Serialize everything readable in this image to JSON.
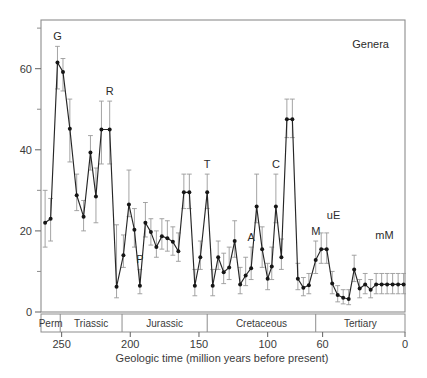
{
  "figure": {
    "panel_label": "(b)",
    "series_note": "Genera"
  },
  "chart_data": {
    "type": "line",
    "title": "",
    "subtitle": "",
    "xlabel": "Geologic time (million years before present)",
    "ylabel": "",
    "series_label": "Genera",
    "panel_label": "(b)",
    "xlim": [
      265,
      0
    ],
    "ylim": [
      0,
      72
    ],
    "x_reversed": true,
    "grid": false,
    "legend_position": "none",
    "x_ticks_major": [
      250,
      200,
      150,
      100,
      60,
      0
    ],
    "x_tick_labels": [
      "250",
      "200",
      "150",
      "100",
      "60",
      "0"
    ],
    "y_ticks_major": [
      0,
      20,
      40,
      60
    ],
    "y_tick_labels": [
      "0",
      "20",
      "40",
      "60"
    ],
    "y_ticks_minor": [
      10,
      30,
      50,
      70
    ],
    "marker": "filled-circle",
    "error_bars": "vertical",
    "period_bands": [
      {
        "name": "Perm",
        "start": 265,
        "end": 251
      },
      {
        "name": "Triassic",
        "start": 251,
        "end": 206
      },
      {
        "name": "Jurassic",
        "start": 206,
        "end": 144
      },
      {
        "name": "Cretaceous",
        "start": 144,
        "end": 65
      },
      {
        "name": "Tertiary",
        "start": 65,
        "end": 0
      }
    ],
    "annotations": [
      {
        "label": "G",
        "x": 253,
        "y": 61.5
      },
      {
        "label": "R",
        "x": 215,
        "y": 45.0
      },
      {
        "label": "P",
        "x": 193,
        "y": 26.5
      },
      {
        "label": "T",
        "x": 144,
        "y": 29.5
      },
      {
        "label": "A",
        "x": 112,
        "y": 17.5
      },
      {
        "label": "C",
        "x": 94,
        "y": 26.0
      },
      {
        "label": "M",
        "x": 65,
        "y": 47.5
      },
      {
        "label": "uE",
        "x": 52,
        "y": 15.5
      },
      {
        "label": "mM",
        "x": 15,
        "y": 10.5
      }
    ],
    "x": [
      262,
      258,
      253,
      249,
      244,
      239,
      234,
      229,
      225,
      221,
      215,
      210,
      205,
      201,
      197,
      193,
      189,
      185,
      181,
      177,
      173,
      169,
      165,
      161,
      157,
      153,
      149,
      144,
      140,
      136,
      132,
      128,
      124,
      120,
      116,
      112,
      108,
      104,
      100,
      97,
      94,
      90,
      86,
      82,
      78,
      74,
      70,
      65,
      61,
      57,
      53,
      49,
      45,
      41,
      37,
      33,
      29,
      25,
      21,
      17,
      13,
      9,
      5,
      1
    ],
    "y": [
      22.0,
      23.0,
      61.5,
      59.2,
      45.2,
      28.8,
      23.5,
      39.3,
      28.5,
      45.0,
      45.0,
      6.2,
      14.0,
      26.5,
      20.3,
      6.5,
      22.0,
      19.7,
      16.0,
      18.7,
      18.2,
      17.3,
      15.0,
      29.5,
      29.5,
      6.5,
      13.5,
      29.5,
      6.5,
      13.5,
      9.8,
      11.0,
      17.5,
      6.8,
      9.0,
      10.8,
      26.0,
      15.5,
      8.2,
      11.2,
      26.0,
      13.5,
      47.5,
      47.5,
      8.2,
      6.0,
      6.6,
      12.8,
      15.5,
      15.5,
      7.0,
      4.2,
      3.5,
      3.2,
      10.5,
      5.8,
      6.8,
      5.5,
      6.8,
      6.8,
      6.8,
      6.8,
      6.8,
      6.8
    ],
    "values_note": "Genus-level origination/extinction metric per stratigraphic interval",
    "err_low": [
      16.0,
      17.5,
      55.0,
      54.5,
      37.0,
      25.0,
      20.0,
      35.0,
      22.0,
      36.5,
      36.5,
      3.5,
      11.0,
      23.5,
      16.0,
      4.5,
      18.5,
      16.5,
      13.5,
      15.5,
      15.0,
      14.0,
      12.5,
      25.5,
      25.5,
      4.0,
      10.5,
      25.5,
      4.0,
      10.5,
      7.0,
      8.0,
      13.5,
      4.5,
      6.5,
      8.0,
      22.0,
      11.0,
      5.5,
      8.0,
      22.0,
      10.5,
      43.0,
      43.0,
      5.5,
      4.0,
      4.5,
      9.5,
      12.0,
      12.0,
      4.5,
      2.5,
      2.0,
      1.8,
      7.5,
      3.5,
      4.5,
      3.5,
      4.5,
      4.5,
      4.5,
      4.5,
      4.5,
      4.5
    ],
    "err_high": [
      30.0,
      28.0,
      65.5,
      62.5,
      52.5,
      34.0,
      27.5,
      43.5,
      35.5,
      52.0,
      52.0,
      21.5,
      19.0,
      35.0,
      25.5,
      10.5,
      27.0,
      23.0,
      20.0,
      23.0,
      22.5,
      21.0,
      19.5,
      34.0,
      34.0,
      10.5,
      17.5,
      34.0,
      10.5,
      17.5,
      14.5,
      16.0,
      22.5,
      11.0,
      13.5,
      16.0,
      34.0,
      21.0,
      12.0,
      16.0,
      34.0,
      18.0,
      52.5,
      52.5,
      12.0,
      8.5,
      9.5,
      17.5,
      19.5,
      19.5,
      10.0,
      6.5,
      5.5,
      5.5,
      14.0,
      8.0,
      9.5,
      8.0,
      9.5,
      9.5,
      9.5,
      9.5,
      9.5,
      9.5
    ]
  }
}
